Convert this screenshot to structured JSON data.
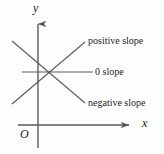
{
  "figure": {
    "background_color": "#fdfdfd",
    "stroke_color": "#58595b",
    "text_color": "#231f20"
  },
  "axes": {
    "y_label": "y",
    "x_label": "x",
    "origin_label": "O",
    "y_axis": {
      "x": 38,
      "y_top": 22,
      "y_bottom": 148,
      "arrow": "up"
    },
    "x_axis": {
      "y": 125,
      "x_left": 18,
      "x_right": 130,
      "arrow": "right"
    }
  },
  "lines": [
    {
      "name": "positive-slope-line",
      "label": "positive slope",
      "slope": "positive",
      "x1": 12,
      "y1": 104,
      "x2": 85,
      "y2": 42
    },
    {
      "name": "zero-slope-line",
      "label": "0 slope",
      "slope": "zero",
      "x1": 22,
      "y1": 72,
      "x2": 93,
      "y2": 72
    },
    {
      "name": "negative-slope-line",
      "label": "negative slope",
      "slope": "negative",
      "x1": 12,
      "y1": 41,
      "x2": 85,
      "y2": 103
    }
  ],
  "intersection": {
    "x": 50,
    "y": 72
  }
}
